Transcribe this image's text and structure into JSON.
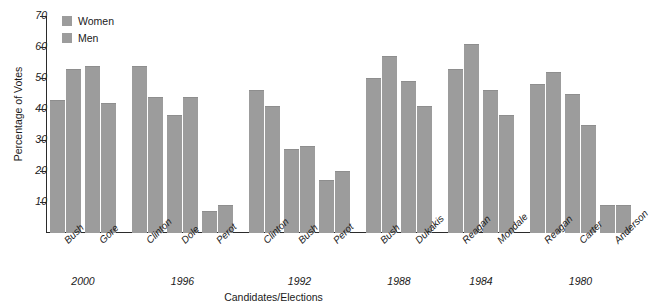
{
  "chart_data": {
    "type": "bar",
    "title": "",
    "xlabel": "Candidates/Elections",
    "ylabel": "Percentage of Votes",
    "ylim": [
      0,
      70
    ],
    "yticks": [
      10,
      20,
      30,
      40,
      50,
      60,
      70
    ],
    "grid": false,
    "legend_position": "top-left",
    "categories": [
      "Bush",
      "Gore",
      "Clinton",
      "Dole",
      "Perot",
      "Clinton",
      "Bush",
      "Perot",
      "Bush",
      "Dukakis",
      "Reagan",
      "Mondale",
      "Reagan",
      "Carter",
      "Anderson"
    ],
    "groups": [
      {
        "year": "2000",
        "candidates": [
          "Bush",
          "Gore"
        ]
      },
      {
        "year": "1996",
        "candidates": [
          "Clinton",
          "Dole",
          "Perot"
        ]
      },
      {
        "year": "1992",
        "candidates": [
          "Clinton",
          "Bush",
          "Perot"
        ]
      },
      {
        "year": "1988",
        "candidates": [
          "Bush",
          "Dukakis"
        ]
      },
      {
        "year": "1984",
        "candidates": [
          "Reagan",
          "Mondale"
        ]
      },
      {
        "year": "1980",
        "candidates": [
          "Reagan",
          "Carter",
          "Anderson"
        ]
      }
    ],
    "series": [
      {
        "name": "Women",
        "color": "#9c9c9c",
        "values": [
          43,
          54,
          54,
          38,
          7,
          46,
          27,
          17,
          50,
          49,
          53,
          46,
          48,
          45,
          9
        ]
      },
      {
        "name": "Men",
        "color": "#9c9c9c",
        "values": [
          53,
          42,
          44,
          44,
          9,
          41,
          28,
          20,
          57,
          41,
          61,
          38,
          52,
          35,
          9
        ]
      }
    ]
  },
  "legend": {
    "items": [
      {
        "label": "Women"
      },
      {
        "label": "Men"
      }
    ]
  },
  "axes": {
    "y_title": "Percentage of Votes",
    "x_title": "Candidates/Elections"
  }
}
